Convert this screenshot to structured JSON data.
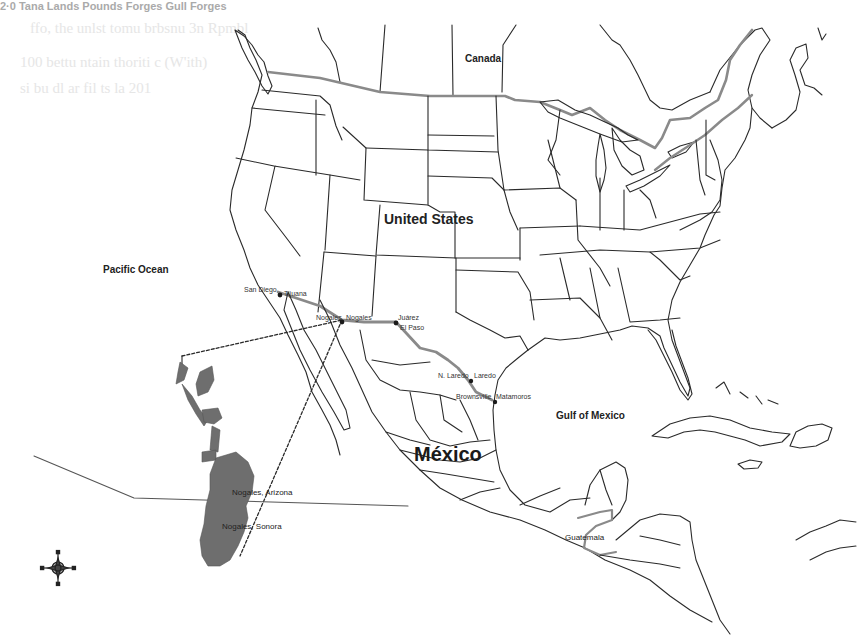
{
  "header_fragment": "2·0   Tana Lands Pounds Forges Gull Forges",
  "labels": {
    "canada": "Canada",
    "united_states": "United States",
    "mexico": "México",
    "pacific_ocean": "Pacific Ocean",
    "gulf_of_mexico": "Gulf of Mexico",
    "guatemala": "Guatemala"
  },
  "border_cities": [
    {
      "name": "San Diego",
      "x": 244,
      "y": 290
    },
    {
      "name": "Tijuana",
      "x": 283,
      "y": 290
    },
    {
      "name": "Nogales",
      "x": 316,
      "y": 318
    },
    {
      "name": "Nogales",
      "x": 348,
      "y": 318
    },
    {
      "name": "Juárez",
      "x": 398,
      "y": 316
    },
    {
      "name": "El Paso",
      "x": 397,
      "y": 326
    },
    {
      "name": "N. Laredo",
      "x": 438,
      "y": 374
    },
    {
      "name": "Laredo",
      "x": 476,
      "y": 374
    },
    {
      "name": "Brownsville",
      "x": 457,
      "y": 393
    },
    {
      "name": "Matamoros",
      "x": 497,
      "y": 393
    }
  ],
  "inset": {
    "label_us": "Nogales, Arizona",
    "label_mx": "Nogales, Sonora"
  },
  "legend": {
    "compass_icon": "compass-rose"
  },
  "colors": {
    "border_highlight": "#9a9a9a",
    "urban_fill": "#6e6e6e",
    "outline": "#2a2a2a"
  }
}
